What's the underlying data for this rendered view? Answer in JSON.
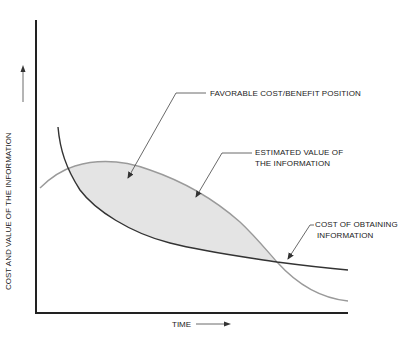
{
  "diagram": {
    "y_axis_label": "COST AND VALUE OF THE INFORMATION",
    "x_axis_label": "TIME",
    "annotations": {
      "favorable": "FAVORABLE COST/BENEFIT POSITION",
      "estimated_line1": "ESTIMATED VALUE OF",
      "estimated_line2": "THE INFORMATION",
      "cost_line1": "COST OF OBTAINING",
      "cost_line2": "INFORMATION"
    },
    "colors": {
      "axis": "#222222",
      "cost_curve": "#333333",
      "value_curve": "#999999",
      "shaded_region": "#e4e4e4",
      "leader": "#444444"
    },
    "curves": {
      "cost_of_obtaining_information": "decreasing steeply then flattening",
      "estimated_value_of_information": "rises to a peak then declines below cost"
    }
  }
}
